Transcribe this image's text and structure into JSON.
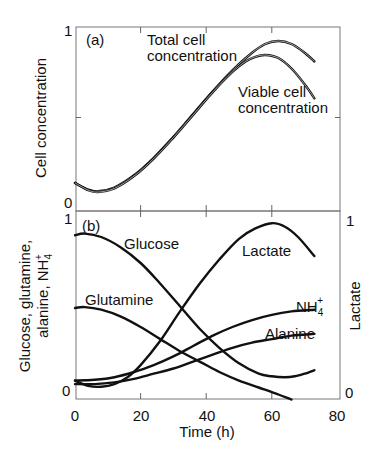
{
  "chart_data": [
    {
      "type": "line",
      "panel_label": "(a)",
      "title": "",
      "xlabel": "",
      "ylabel": "Cell concentration",
      "xlim": [
        0,
        80
      ],
      "ylim": [
        0,
        1
      ],
      "yticks": [
        "0",
        "1"
      ],
      "x_ticks_values": [
        0,
        20,
        40,
        60,
        80
      ],
      "grid": false,
      "series": [
        {
          "name": "Total cell concentration",
          "label_lines": [
            "Total cell",
            "concentration"
          ],
          "x": [
            0,
            4,
            7,
            12,
            18,
            24,
            30,
            36,
            42,
            48,
            54,
            58,
            62,
            66,
            70,
            73
          ],
          "y": [
            0.126,
            0.088,
            0.078,
            0.1,
            0.17,
            0.27,
            0.39,
            0.52,
            0.65,
            0.77,
            0.87,
            0.92,
            0.937,
            0.92,
            0.87,
            0.82
          ]
        },
        {
          "name": "Viable cell concentration",
          "label_lines": [
            "Viable cell",
            "concentration"
          ],
          "x": [
            0,
            4,
            7,
            12,
            18,
            24,
            30,
            36,
            42,
            48,
            52,
            55,
            58,
            62,
            66,
            70,
            73
          ],
          "y": [
            0.126,
            0.085,
            0.074,
            0.095,
            0.165,
            0.265,
            0.385,
            0.515,
            0.645,
            0.76,
            0.82,
            0.847,
            0.857,
            0.84,
            0.78,
            0.69,
            0.61
          ]
        }
      ]
    },
    {
      "type": "line",
      "panel_label": "(b)",
      "title": "",
      "xlabel": "Time (h)",
      "ylabel": "Glucose, glutamine, alanine, NH4+",
      "ylabel_lines": [
        "Glucose, glutamine,",
        "alanine, NH"
      ],
      "ylabel_sub": "4",
      "ylabel_sup": "+",
      "y2label": "Lactate",
      "xlim": [
        0,
        80
      ],
      "ylim": [
        0,
        1
      ],
      "y2lim": [
        0,
        1
      ],
      "xticks": [
        "0",
        "20",
        "40",
        "60",
        "80"
      ],
      "x_ticks_values": [
        0,
        20,
        40,
        60,
        80
      ],
      "yticks": [
        "0",
        "1"
      ],
      "y2ticks": [
        "0",
        "1"
      ],
      "grid": false,
      "series": [
        {
          "name": "Glucose",
          "x": [
            0,
            3,
            8,
            14,
            20,
            26,
            32,
            38,
            44,
            50,
            56,
            60,
            64,
            67,
            70,
            73
          ],
          "y": [
            0.9,
            0.91,
            0.89,
            0.83,
            0.74,
            0.62,
            0.49,
            0.36,
            0.25,
            0.16,
            0.1,
            0.085,
            0.08,
            0.085,
            0.1,
            0.12
          ]
        },
        {
          "name": "Glutamine",
          "x": [
            0,
            3,
            8,
            14,
            20,
            26,
            32,
            38,
            44,
            50,
            56,
            62,
            66
          ],
          "y": [
            0.48,
            0.485,
            0.47,
            0.43,
            0.37,
            0.3,
            0.23,
            0.17,
            0.11,
            0.06,
            0.02,
            -0.02,
            -0.05
          ]
        },
        {
          "name": "Lactate",
          "axis": "right",
          "x": [
            0,
            4,
            8,
            12,
            16,
            20,
            26,
            32,
            38,
            44,
            50,
            55,
            60,
            64,
            68,
            73
          ],
          "y": [
            0.06,
            0.03,
            0.025,
            0.04,
            0.08,
            0.15,
            0.29,
            0.46,
            0.62,
            0.76,
            0.88,
            0.94,
            0.97,
            0.95,
            0.89,
            0.78
          ]
        },
        {
          "name": "NH4+",
          "label_main": "NH",
          "label_sub": "4",
          "label_sup": "+",
          "x": [
            0,
            6,
            12,
            18,
            24,
            30,
            36,
            42,
            48,
            54,
            60,
            66,
            73
          ],
          "y": [
            0.06,
            0.065,
            0.08,
            0.11,
            0.15,
            0.2,
            0.26,
            0.32,
            0.37,
            0.41,
            0.44,
            0.46,
            0.47
          ]
        },
        {
          "name": "Alanine",
          "x": [
            0,
            6,
            12,
            18,
            24,
            30,
            36,
            42,
            48,
            54,
            60,
            66,
            73
          ],
          "y": [
            0.04,
            0.04,
            0.05,
            0.07,
            0.1,
            0.13,
            0.17,
            0.21,
            0.25,
            0.28,
            0.3,
            0.32,
            0.33
          ]
        }
      ]
    }
  ]
}
